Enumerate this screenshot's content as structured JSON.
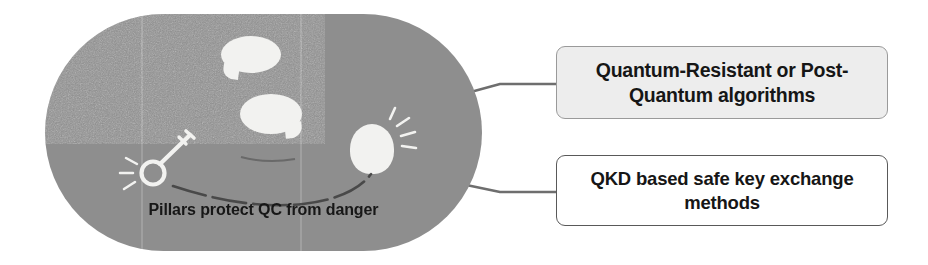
{
  "diagram": {
    "title_caption": "Pillars protect QC from danger",
    "shape": {
      "name": "stadium-pill",
      "fill_color": "#8e8e8e",
      "texture": "grainy-noise"
    },
    "icons": [
      {
        "name": "speech-bubble-upper",
        "tail": "bottom-left",
        "color": "#f2f2f0"
      },
      {
        "name": "speech-bubble-middle",
        "tail": "bottom-right",
        "color": "#f2f2f0"
      },
      {
        "name": "key-icon",
        "color": "#f2f2f0",
        "detail": "key with shine rays"
      },
      {
        "name": "lightbulb-icon",
        "color": "#f2f2f0",
        "detail": "bulb with shine rays"
      },
      {
        "name": "curved-connector-line",
        "color": "#3a3a3a"
      }
    ],
    "callouts": [
      {
        "id": "callout-1",
        "label": "Quantum-Resistant or Post-Quantum algorithms",
        "fill_color": "#ededed",
        "border_color": "#9a9a9a",
        "text_color": "#161616"
      },
      {
        "id": "callout-2",
        "label": "QKD based safe key exchange methods",
        "fill_color": "#ffffff",
        "border_color": "#595959",
        "text_color": "#161616"
      }
    ],
    "connectors": [
      {
        "name": "connector-to-callout-1",
        "color": "#6e6e6e"
      },
      {
        "name": "connector-to-callout-2",
        "color": "#6e6e6e"
      }
    ]
  }
}
